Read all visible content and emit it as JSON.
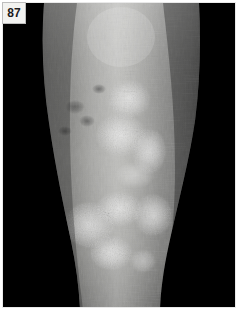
{
  "figure": {
    "number": "87",
    "label_text": "87",
    "modality": "clinical-photograph",
    "color_mode": "grayscale",
    "findings": [
      "well-demarcated plaques",
      "silvery adherent scale",
      "confluent lesions mid-shin",
      "background xerosis and fine skin creasing",
      "scattered darker macules upper medial shin"
    ]
  },
  "colors": {
    "background": "#000000",
    "frame_border": "#e9e9e9",
    "label_background": "#f2f2f0",
    "label_border": "#bdbdbd",
    "label_text": "#1c1c1c",
    "skin_mid": "#8d8d8d",
    "skin_highlight": "#d8d8d6",
    "skin_shadow": "#3a3a3a",
    "plaque_scale": "#e2e2de",
    "plaque_base": "#a9a9a6"
  },
  "canvas": {
    "width": 238,
    "height": 310,
    "photo_width": 234,
    "photo_height": 306
  },
  "limb": {
    "top_left_x": 43,
    "top_right_x": 198,
    "bottom_left_x": 73,
    "bottom_right_x": 158,
    "note": "limb tapers from knee region at top toward ankle at bottom"
  },
  "lesions": [
    {
      "id": "plaque-upper",
      "cx": 126,
      "cy": 96,
      "rx": 22,
      "ry": 20,
      "intensity": "moderate"
    },
    {
      "id": "plaque-mid-upper",
      "cx": 118,
      "cy": 132,
      "rx": 26,
      "ry": 22,
      "intensity": "bright"
    },
    {
      "id": "plaque-mid-right",
      "cx": 146,
      "cy": 148,
      "rx": 18,
      "ry": 24,
      "intensity": "bright"
    },
    {
      "id": "plaque-lower-left",
      "cx": 86,
      "cy": 222,
      "rx": 26,
      "ry": 24,
      "intensity": "bright"
    },
    {
      "id": "plaque-lower-center",
      "cx": 116,
      "cy": 206,
      "rx": 24,
      "ry": 18,
      "intensity": "bright"
    },
    {
      "id": "plaque-lower-right",
      "cx": 150,
      "cy": 212,
      "rx": 20,
      "ry": 22,
      "intensity": "moderate"
    },
    {
      "id": "plaque-bottom",
      "cx": 108,
      "cy": 250,
      "rx": 22,
      "ry": 18,
      "intensity": "bright"
    }
  ]
}
